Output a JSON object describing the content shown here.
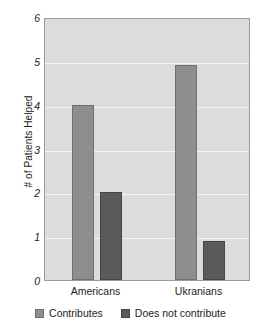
{
  "chart_data": {
    "type": "bar",
    "title": "",
    "xlabel": "",
    "ylabel": "# of Patients Helped",
    "categories": [
      "Americans",
      "Ukranians"
    ],
    "series": [
      {
        "name": "Contributes",
        "color": "#8e8e8e",
        "values": [
          4.0,
          4.9
        ]
      },
      {
        "name": "Does not contribute",
        "color": "#5a5a5a",
        "values": [
          2.0,
          0.9
        ]
      }
    ],
    "ylim": [
      0,
      6
    ],
    "yticks": [
      0,
      1,
      2,
      3,
      4,
      5,
      6
    ],
    "ytick_labels": [
      "0",
      "1",
      "2",
      "3",
      "4",
      "5",
      "6"
    ],
    "grid": true,
    "legend_position": "bottom",
    "plot_background": "#dcdcdc",
    "gridline_color": "#f4f4f4",
    "axis_color": "#9a9a9a"
  },
  "axis": {
    "y_title": "# of Patients Helped"
  },
  "legend": {
    "items": [
      {
        "label": "Contributes"
      },
      {
        "label": "Does not contribute"
      }
    ]
  }
}
